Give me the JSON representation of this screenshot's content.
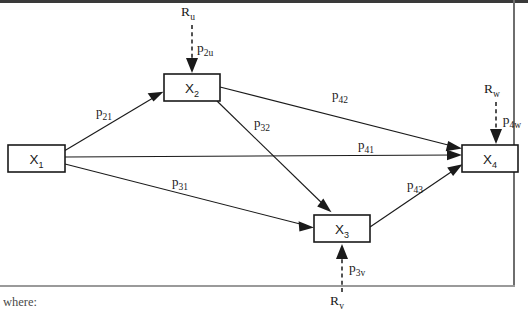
{
  "figure": {
    "type": "path-analysis-diagram",
    "caption": "where:"
  },
  "nodes": [
    {
      "id": "x1",
      "base": "X",
      "sub": "1",
      "label": "X₁",
      "x": 8,
      "y": 145,
      "w": 57,
      "h": 27
    },
    {
      "id": "x2",
      "base": "X",
      "sub": "2",
      "label": "X₂",
      "x": 164,
      "y": 74,
      "w": 56,
      "h": 27
    },
    {
      "id": "x3",
      "base": "X",
      "sub": "3",
      "label": "X₃",
      "x": 314,
      "y": 215,
      "w": 56,
      "h": 27
    },
    {
      "id": "x4",
      "base": "X",
      "sub": "4",
      "label": "X₄",
      "x": 462,
      "y": 145,
      "w": 56,
      "h": 27
    }
  ],
  "paths": [
    {
      "id": "p21",
      "base": "p",
      "sub": "21",
      "label": "p₂₁",
      "from": "x1",
      "to": "x2",
      "label_x": 104,
      "label_y": 116
    },
    {
      "id": "p31",
      "base": "p",
      "sub": "31",
      "label": "p₃₁",
      "from": "x1",
      "to": "x3",
      "label_x": 180,
      "label_y": 186
    },
    {
      "id": "p32",
      "base": "p",
      "sub": "32",
      "label": "p₃₂",
      "from": "x2",
      "to": "x3",
      "label_x": 262,
      "label_y": 127
    },
    {
      "id": "p41",
      "base": "p",
      "sub": "41",
      "label": "p₄₁",
      "from": "x1",
      "to": "x4",
      "label_x": 366,
      "label_y": 149
    },
    {
      "id": "p42",
      "base": "p",
      "sub": "42",
      "label": "p₄₂",
      "from": "x2",
      "to": "x4",
      "label_x": 340,
      "label_y": 99
    },
    {
      "id": "p43",
      "base": "p",
      "sub": "43",
      "label": "p₄₃",
      "from": "x3",
      "to": "x4",
      "label_x": 415,
      "label_y": 189
    }
  ],
  "residuals": [
    {
      "id": "ru",
      "source_base": "R",
      "source_sub": "u",
      "source_label": "Rᵤ",
      "coef_base": "p",
      "coef_sub": "2u",
      "coef_label": "p₂ᵤ",
      "to": "x2",
      "source_x": 188,
      "source_y": 16,
      "coef_x": 205,
      "coef_y": 52
    },
    {
      "id": "rv",
      "source_base": "R",
      "source_sub": "v",
      "source_label": "Rᵥ",
      "coef_base": "p",
      "coef_sub": "3v",
      "coef_label": "p₃ᵥ",
      "to": "x3",
      "source_x": 337,
      "source_y": 302,
      "coef_x": 357,
      "coef_y": 272
    },
    {
      "id": "rw",
      "source_base": "R",
      "source_sub": "w",
      "source_label": "Rᵥᵥ",
      "coef_base": "p",
      "coef_sub": "4w",
      "coef_label": "p₄w",
      "to": "x4",
      "source_x": 492,
      "source_y": 93,
      "coef_x": 510,
      "coef_y": 124
    }
  ],
  "colors": {
    "stroke": "#1a1a1a",
    "background": "#ffffff",
    "frame": "#3a3a3a",
    "caption": "#4a4a4a"
  }
}
